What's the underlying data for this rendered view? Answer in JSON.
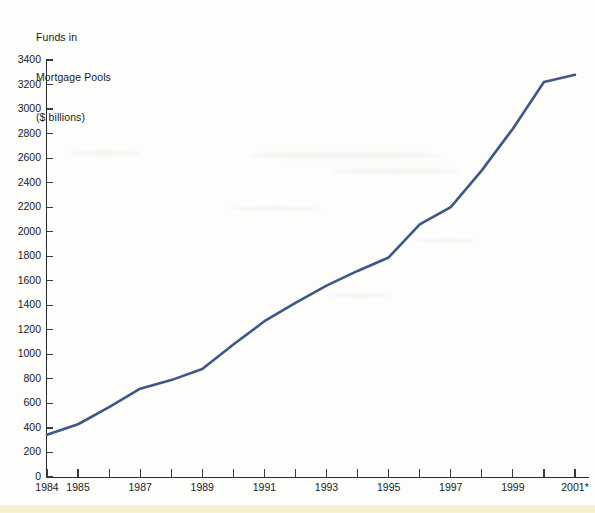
{
  "chart_data": {
    "type": "line",
    "title": "Funds in Mortgage Pools ($ billions)",
    "title_lines": [
      "Funds in",
      "Mortgage Pools",
      "($ billions)"
    ],
    "xlabel": "",
    "ylabel": "",
    "ylim": [
      0,
      3400
    ],
    "xlim": [
      1984,
      2001
    ],
    "ytick_step": 200,
    "grid": false,
    "legend": null,
    "annotations": [
      "* 2001 figure is preliminary (denoted by asterisk on axis label)"
    ],
    "yticks": [
      0,
      200,
      400,
      600,
      800,
      1000,
      1200,
      1400,
      1600,
      1800,
      2000,
      2200,
      2400,
      2600,
      2800,
      3000,
      3200,
      3400
    ],
    "ytick_labels": [
      "0",
      "200",
      "400",
      "600",
      "800",
      "1000",
      "1200",
      "1400",
      "1600",
      "1800",
      "2000",
      "2200",
      "2400",
      "2600",
      "2800",
      "3000",
      "3200",
      "3400"
    ],
    "xticks": [
      1984,
      1985,
      1986,
      1987,
      1988,
      1989,
      1990,
      1991,
      1992,
      1993,
      1994,
      1995,
      1996,
      1997,
      1998,
      1999,
      2000,
      2001
    ],
    "xtick_labels_visible": [
      {
        "x": 1984,
        "label": "1984"
      },
      {
        "x": 1985,
        "label": "1985"
      },
      {
        "x": 1987,
        "label": "1987"
      },
      {
        "x": 1989,
        "label": "1989"
      },
      {
        "x": 1991,
        "label": "1991"
      },
      {
        "x": 1993,
        "label": "1993"
      },
      {
        "x": 1995,
        "label": "1995"
      },
      {
        "x": 1997,
        "label": "1997"
      },
      {
        "x": 1999,
        "label": "1999"
      },
      {
        "x": 2001,
        "label": "2001*"
      }
    ],
    "x": [
      1984,
      1985,
      1986,
      1987,
      1988,
      1989,
      1990,
      1991,
      1992,
      1993,
      1994,
      1995,
      1996,
      1997,
      1998,
      1999,
      2000,
      2001
    ],
    "values": [
      345,
      430,
      570,
      720,
      790,
      880,
      1080,
      1270,
      1420,
      1560,
      1680,
      1790,
      2060,
      2200,
      2500,
      2840,
      3220,
      3280
    ],
    "series": [
      {
        "name": "Funds in Mortgage Pools",
        "color": "#3f5787",
        "line_width": 2.6,
        "values": [
          345,
          430,
          570,
          720,
          790,
          880,
          1080,
          1270,
          1420,
          1560,
          1680,
          1790,
          2060,
          2200,
          2500,
          2840,
          3220,
          3280
        ]
      }
    ]
  },
  "colors": {
    "series_line": "#3f5787",
    "axis": "#2a2a2a",
    "text": "#1b1b1b",
    "page_background": "#fdfdfc",
    "bottom_strip": "#f7f1cf"
  }
}
